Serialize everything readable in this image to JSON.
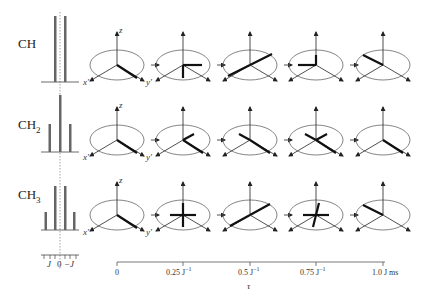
{
  "rows": [
    {
      "label": "CH",
      "sub": "",
      "spectrum": {
        "lines": [
          {
            "pos": -0.5,
            "height": 1.0
          },
          {
            "pos": 0.5,
            "height": 1.0
          }
        ]
      }
    },
    {
      "label": "CH",
      "sub": "2",
      "spectrum": {
        "lines": [
          {
            "pos": -1,
            "height": 0.5
          },
          {
            "pos": 0,
            "height": 1.0
          },
          {
            "pos": 1,
            "height": 0.5
          }
        ]
      }
    },
    {
      "label": "CH",
      "sub": "3",
      "spectrum": {
        "lines": [
          {
            "pos": -1.5,
            "height": 0.33
          },
          {
            "pos": -0.5,
            "height": 1.0
          },
          {
            "pos": 0.5,
            "height": 1.0
          },
          {
            "pos": 1.5,
            "height": 0.33
          }
        ]
      }
    }
  ],
  "axes_labels": {
    "z": "z",
    "x": "x′",
    "y": "y′"
  },
  "spectrum_axis": {
    "left": "J",
    "zero": "0",
    "right": "−J"
  },
  "time_axis": {
    "ticks": [
      {
        "label": "0",
        "sup": ""
      },
      {
        "label": "0.25 J",
        "sup": "−1"
      },
      {
        "label": "0.5 J",
        "sup": "−1"
      },
      {
        "label": "0.75 J",
        "sup": "−1"
      },
      {
        "label": "1.0 J  ms",
        "sup": ""
      }
    ],
    "title": "τ"
  },
  "colors": {
    "line": "#333333",
    "vector": "#111111",
    "ellipse": "#666666",
    "bar": "#666666",
    "dotted": "#888888"
  }
}
